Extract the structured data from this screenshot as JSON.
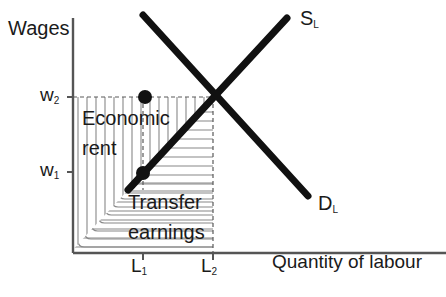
{
  "figure": {
    "type": "economics-labour-market-diagram",
    "title_axis_y": "Wages",
    "title_axis_x": "Quantity of labour",
    "caption": "Wage theory and how inflammatory earnings"
  },
  "axes": {
    "y_label": "Wages",
    "x_label": "Quantity of labour",
    "y_ticks": [
      {
        "name": "w2",
        "base": "w",
        "sub": "2",
        "y_px": 97
      },
      {
        "name": "w1",
        "base": "w",
        "sub": "1",
        "y_px": 172
      }
    ],
    "x_ticks": [
      {
        "name": "L1",
        "base": "L",
        "sub": "1",
        "x_px": 143
      },
      {
        "name": "L2",
        "base": "L",
        "sub": "2",
        "x_px": 213
      }
    ],
    "origin_px": {
      "x": 73,
      "y": 253
    },
    "y_axis_top_px": 18,
    "x_axis_right_px": 446
  },
  "curves": [
    {
      "name": "supply-of-labour",
      "label_base": "S",
      "label_sub": "L",
      "label_pos": {
        "x": 300,
        "y": 22
      },
      "from": {
        "x": 128,
        "y": 190
      },
      "to": {
        "x": 287,
        "y": 18
      },
      "color": "#111111",
      "width": 7
    },
    {
      "name": "demand-for-labour",
      "label_base": "D",
      "label_sub": "L",
      "label_pos": {
        "x": 318,
        "y": 207
      },
      "from": {
        "x": 143,
        "y": 15
      },
      "to": {
        "x": 308,
        "y": 196
      },
      "color": "#111111",
      "width": 7
    }
  ],
  "points": [
    {
      "name": "point-upper",
      "x": 145,
      "y": 97,
      "r": 7
    },
    {
      "name": "point-lower",
      "x": 143,
      "y": 173,
      "r": 7
    }
  ],
  "equilibrium": {
    "name": "equilibrium-intersection",
    "x": 213,
    "y": 98
  },
  "regions": [
    {
      "name": "economic-rent",
      "label_line1": "Economic",
      "label_line2": "rent",
      "label_pos": {
        "x": 82,
        "y": 108
      },
      "hatch": "vertical",
      "bounds": {
        "x": 73,
        "y": 97,
        "w": 140,
        "h": 93
      }
    },
    {
      "name": "transfer-earnings",
      "label_line1": "Transfer",
      "label_line2": "earnings",
      "label_pos": {
        "x": 128,
        "y": 196
      },
      "hatch": "horizontal",
      "bounds": {
        "x": 73,
        "y": 97,
        "w": 140,
        "h": 156
      }
    }
  ],
  "guides": [
    {
      "name": "guide-w2-horizontal",
      "style": "dashed",
      "x1": 73,
      "y1": 97,
      "x2": 213,
      "y2": 97
    },
    {
      "name": "guide-L2-vertical",
      "style": "dashed",
      "x1": 213,
      "y1": 97,
      "x2": 213,
      "y2": 253
    },
    {
      "name": "guide-L1-vertical",
      "style": "dashed",
      "x1": 143,
      "y1": 97,
      "x2": 143,
      "y2": 190
    }
  ],
  "colors": {
    "ink": "#1a1a1a",
    "curve": "#111111",
    "hatch": "#888888",
    "axis": "#555555",
    "background": "#ffffff"
  }
}
